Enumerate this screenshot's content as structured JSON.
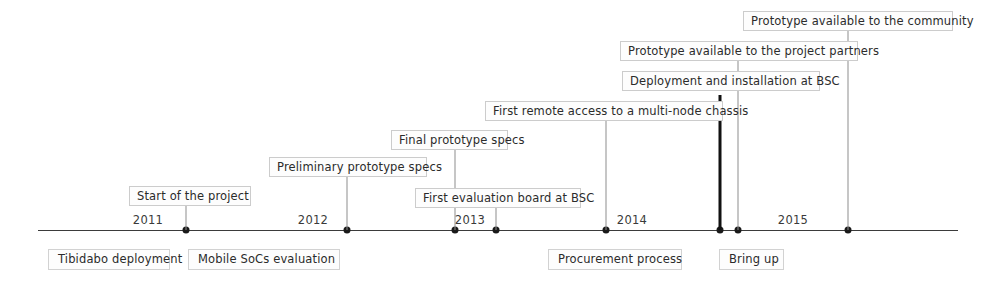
{
  "figure": {
    "type": "timeline",
    "width": 983,
    "height": 288,
    "background_color": "#ffffff",
    "line_color": "#3b3b3b",
    "box_border_color": "#cccccc",
    "box_fill_color": "#fdfdfd",
    "text_color": "#2b2b2b",
    "highlight_color": "#111111"
  },
  "axis": {
    "start_x": 38,
    "end_x": 958,
    "y": 230,
    "years": [
      {
        "label": "2011",
        "x": 148
      },
      {
        "label": "2012",
        "x": 313
      },
      {
        "label": "2013",
        "x": 470
      },
      {
        "label": "2014",
        "x": 632
      },
      {
        "label": "2015",
        "x": 793
      }
    ],
    "markers": [
      {
        "x": 186
      },
      {
        "x": 347
      },
      {
        "x": 455
      },
      {
        "x": 496
      },
      {
        "x": 606
      },
      {
        "x": 720
      },
      {
        "x": 738
      },
      {
        "x": 848
      }
    ]
  },
  "events": [
    {
      "label": "Start of the project",
      "box_left": 129,
      "box_top": 186,
      "box_width": 122,
      "connector_x": 186,
      "connector_top": 206,
      "connector_height": 24,
      "highlight": false
    },
    {
      "label": "Preliminary prototype specs",
      "box_left": 269,
      "box_top": 157,
      "box_width": 158,
      "connector_x": 347,
      "connector_top": 177,
      "connector_height": 53,
      "highlight": false
    },
    {
      "label": "Final prototype specs",
      "box_left": 391,
      "box_top": 130,
      "box_width": 117,
      "connector_x": 455,
      "connector_top": 150,
      "connector_height": 80,
      "highlight": false
    },
    {
      "label": "First evaluation board at BSC",
      "box_left": 415,
      "box_top": 188,
      "box_width": 166,
      "connector_x": 496,
      "connector_top": 208,
      "connector_height": 22,
      "highlight": false
    },
    {
      "label": "First remote access to a multi-node chassis",
      "box_left": 485,
      "box_top": 101,
      "box_width": 238,
      "connector_x": 606,
      "connector_top": 121,
      "connector_height": 109,
      "highlight": false
    },
    {
      "label": "Deployment and installation at BSC",
      "box_left": 622,
      "box_top": 71,
      "box_width": 198,
      "connector_x": 738,
      "connector_top": 91,
      "connector_height": 139,
      "highlight": false
    },
    {
      "label": "Prototype available to the project partners",
      "box_left": 620,
      "box_top": 41,
      "box_width": 238,
      "connector_x": 738,
      "connector_top": 61,
      "connector_height": 10,
      "highlight": false
    },
    {
      "label": "Prototype available to the community",
      "box_left": 743,
      "box_top": 11,
      "box_width": 210,
      "connector_x": 848,
      "connector_top": 31,
      "connector_height": 199,
      "highlight": false
    }
  ],
  "highlight_marker": {
    "name": "bring-up-milestone",
    "x": 720,
    "top": 95,
    "height": 135
  },
  "phases": [
    {
      "label": "Tibidabo deployment",
      "left": 48,
      "top": 249,
      "width": 122
    },
    {
      "label": "Mobile SoCs evaluation",
      "left": 188,
      "top": 249,
      "width": 152
    },
    {
      "label": "Procurement process",
      "left": 548,
      "top": 249,
      "width": 134
    },
    {
      "label": "Bring up",
      "left": 719,
      "top": 249,
      "width": 65
    }
  ]
}
